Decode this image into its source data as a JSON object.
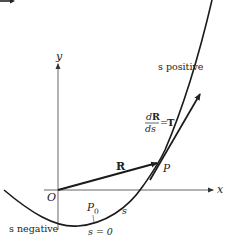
{
  "diagram": {
    "axes": {
      "x_label": "x",
      "y_label": "y",
      "origin_label": "O"
    },
    "labels": {
      "s_positive": "s positive",
      "s_negative": "s negative",
      "derivative_numerator": "dR",
      "derivative_num_d": "d",
      "derivative_num_R": "R",
      "derivative_denominator": "ds",
      "derivative_equals": "=",
      "tangent_symbol": "T",
      "position_vector": "R",
      "point_P": "P",
      "point_P0_base": "P",
      "point_P0_sub": "0",
      "arc_length": "s",
      "s_zero": "s = 0"
    },
    "colors": {
      "ink": "#222222",
      "background": "#ffffff"
    }
  }
}
